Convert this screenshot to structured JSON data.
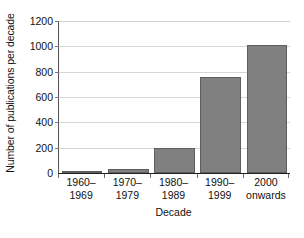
{
  "chart_data": {
    "type": "bar",
    "title": "",
    "subtitle": "",
    "xlabel": "Decade",
    "ylabel": "Number of publications per decade",
    "categories": [
      "1960–\n1969",
      "1970–\n1979",
      "1980–\n1989",
      "1990–\n1999",
      "2000\nonwards"
    ],
    "category_lines": [
      [
        "1960–",
        "1969"
      ],
      [
        "1970–",
        "1979"
      ],
      [
        "1980–",
        "1989"
      ],
      [
        "1990–",
        "1999"
      ],
      [
        "2000",
        "onwards"
      ]
    ],
    "values": [
      5,
      32,
      200,
      755,
      1010
    ],
    "ylim": [
      0,
      1200
    ],
    "yticks": [
      0,
      200,
      400,
      600,
      800,
      1000,
      1200
    ],
    "ytick_labels": [
      "0",
      "200",
      "400",
      "600",
      "800",
      "1000",
      "1200"
    ],
    "grid": "horizontal",
    "legend": "none",
    "bar_color": "#808080",
    "bar_edge_color": "#5e5e5e",
    "grid_color": "#d6d6d6",
    "axis_color": "#222222",
    "background": "#ffffff"
  }
}
